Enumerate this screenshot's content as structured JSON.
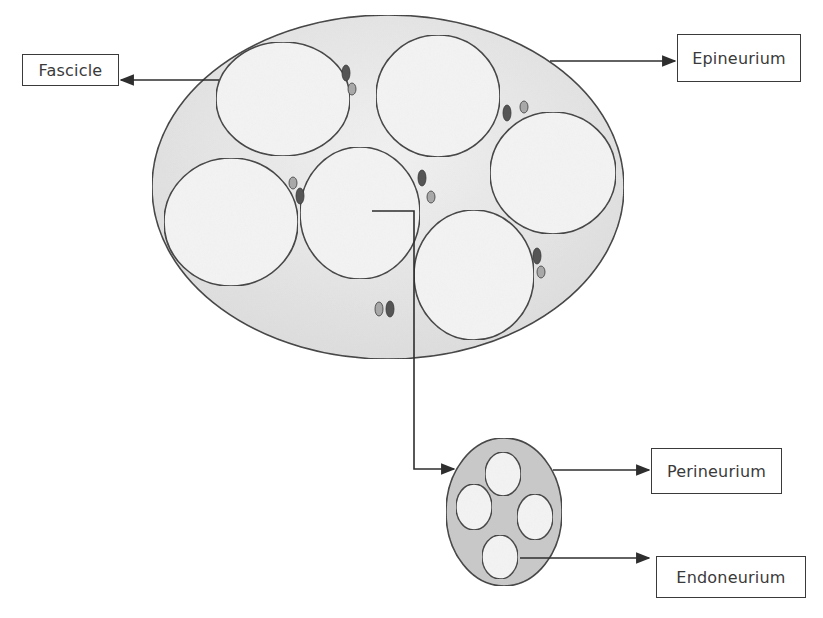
{
  "diagram": {
    "labels": {
      "fascicle": "Fascicle",
      "epineurium": "Epineurium",
      "perineurium": "Perineurium",
      "endoneurium": "Endoneurium"
    },
    "colors": {
      "stroke": "#3a3a3a",
      "outer_fill": "#e8e8e8",
      "fascicle_fill": "#f4f4f4",
      "inset_fill": "#c9c9c9",
      "vessel_dark": "#555555",
      "vessel_light": "#a8a8a8"
    },
    "outer_nerve": {
      "cx": 388,
      "cy": 187,
      "rx": 236,
      "ry": 172
    },
    "fascicles": [
      {
        "cx": 283,
        "cy": 99,
        "rx": 67,
        "ry": 57
      },
      {
        "cx": 438,
        "cy": 96,
        "rx": 62,
        "ry": 61
      },
      {
        "cx": 231,
        "cy": 222,
        "rx": 67,
        "ry": 64
      },
      {
        "cx": 360,
        "cy": 213,
        "rx": 60,
        "ry": 66
      },
      {
        "cx": 553,
        "cy": 173,
        "rx": 63,
        "ry": 61
      },
      {
        "cx": 474,
        "cy": 275,
        "rx": 60,
        "ry": 65
      }
    ],
    "vessels": [
      {
        "cx": 346,
        "cy": 73,
        "rx": 4,
        "ry": 8,
        "tone": "dark"
      },
      {
        "cx": 352,
        "cy": 89,
        "rx": 4,
        "ry": 6,
        "tone": "light"
      },
      {
        "cx": 507,
        "cy": 113,
        "rx": 4,
        "ry": 8,
        "tone": "dark"
      },
      {
        "cx": 524,
        "cy": 107,
        "rx": 4,
        "ry": 6,
        "tone": "light"
      },
      {
        "cx": 293,
        "cy": 183,
        "rx": 4,
        "ry": 6,
        "tone": "light"
      },
      {
        "cx": 300,
        "cy": 196,
        "rx": 4,
        "ry": 8,
        "tone": "dark"
      },
      {
        "cx": 422,
        "cy": 178,
        "rx": 4,
        "ry": 8,
        "tone": "dark"
      },
      {
        "cx": 431,
        "cy": 197,
        "rx": 4,
        "ry": 6,
        "tone": "light"
      },
      {
        "cx": 537,
        "cy": 256,
        "rx": 4,
        "ry": 8,
        "tone": "dark"
      },
      {
        "cx": 541,
        "cy": 272,
        "rx": 4,
        "ry": 6,
        "tone": "light"
      },
      {
        "cx": 379,
        "cy": 309,
        "rx": 4,
        "ry": 7,
        "tone": "light"
      },
      {
        "cx": 390,
        "cy": 309,
        "rx": 4,
        "ry": 8,
        "tone": "dark"
      }
    ],
    "inset": {
      "outer": {
        "cx": 504,
        "cy": 512,
        "rx": 58,
        "ry": 74
      },
      "inner": [
        {
          "cx": 503,
          "cy": 474,
          "rx": 18,
          "ry": 22
        },
        {
          "cx": 474,
          "cy": 507,
          "rx": 18,
          "ry": 23
        },
        {
          "cx": 535,
          "cy": 517,
          "rx": 18,
          "ry": 23
        },
        {
          "cx": 500,
          "cy": 557,
          "rx": 18,
          "ry": 22
        }
      ]
    },
    "label_boxes": {
      "fascicle": {
        "x": 22,
        "y": 54,
        "w": 97,
        "h": 32
      },
      "epineurium": {
        "x": 677,
        "y": 34,
        "w": 124,
        "h": 48
      },
      "perineurium": {
        "x": 651,
        "y": 448,
        "w": 131,
        "h": 46
      },
      "endoneurium": {
        "x": 656,
        "y": 556,
        "w": 150,
        "h": 42
      }
    }
  }
}
